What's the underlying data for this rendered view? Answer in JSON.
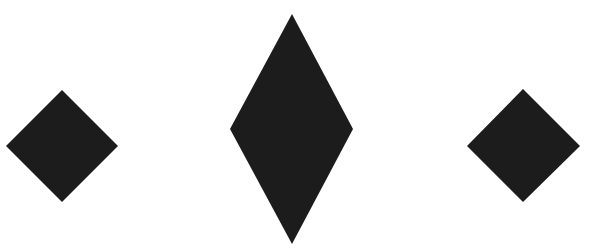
{
  "canvas": {
    "width": 593,
    "height": 251,
    "background": "#ffffff"
  },
  "shapes": [
    {
      "name": "left-diamond",
      "type": "diamond",
      "fill": "#1c1c1c",
      "points": [
        [
          62,
          90
        ],
        [
          118,
          146
        ],
        [
          62,
          202
        ],
        [
          6,
          146
        ]
      ]
    },
    {
      "name": "center-tall-diamond",
      "type": "diamond",
      "fill": "#1c1c1c",
      "points": [
        [
          292,
          14
        ],
        [
          353,
          129
        ],
        [
          292,
          244
        ],
        [
          230,
          129
        ]
      ]
    },
    {
      "name": "right-diamond",
      "type": "diamond",
      "fill": "#1c1c1c",
      "points": [
        [
          523,
          89
        ],
        [
          580,
          146
        ],
        [
          523,
          202
        ],
        [
          467,
          146
        ]
      ]
    }
  ]
}
